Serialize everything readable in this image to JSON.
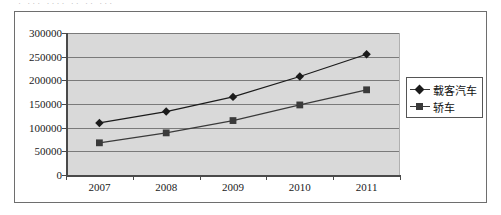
{
  "top_sliver": "· ··· ···· ·· ·· ···",
  "legend": {
    "position": "right",
    "entries": [
      {
        "label": "载客汽车",
        "marker": "diamond",
        "color": "#1b1b1b"
      },
      {
        "label": "轿车",
        "marker": "square",
        "color": "#3a3a3a"
      }
    ]
  },
  "chart_data": {
    "type": "line",
    "title": "",
    "xlabel": "",
    "ylabel": "",
    "categories": [
      "2007",
      "2008",
      "2009",
      "2010",
      "2011"
    ],
    "series": [
      {
        "name": "载客汽车",
        "marker": "diamond",
        "color": "#1b1b1b",
        "values": [
          110000,
          134000,
          165000,
          208000,
          255000
        ]
      },
      {
        "name": "轿车",
        "marker": "square",
        "color": "#3a3a3a",
        "values": [
          68000,
          89000,
          115000,
          148000,
          180000
        ]
      }
    ],
    "ylim": [
      0,
      300000
    ],
    "yticks": [
      0,
      50000,
      100000,
      150000,
      200000,
      250000,
      300000
    ],
    "ytick_labels": [
      "0",
      "50000",
      "100000",
      "150000",
      "200000",
      "250000",
      "300000"
    ],
    "grid": true,
    "plot_background": "#d9d9d9",
    "gridline_color": "#7a7a7a"
  }
}
